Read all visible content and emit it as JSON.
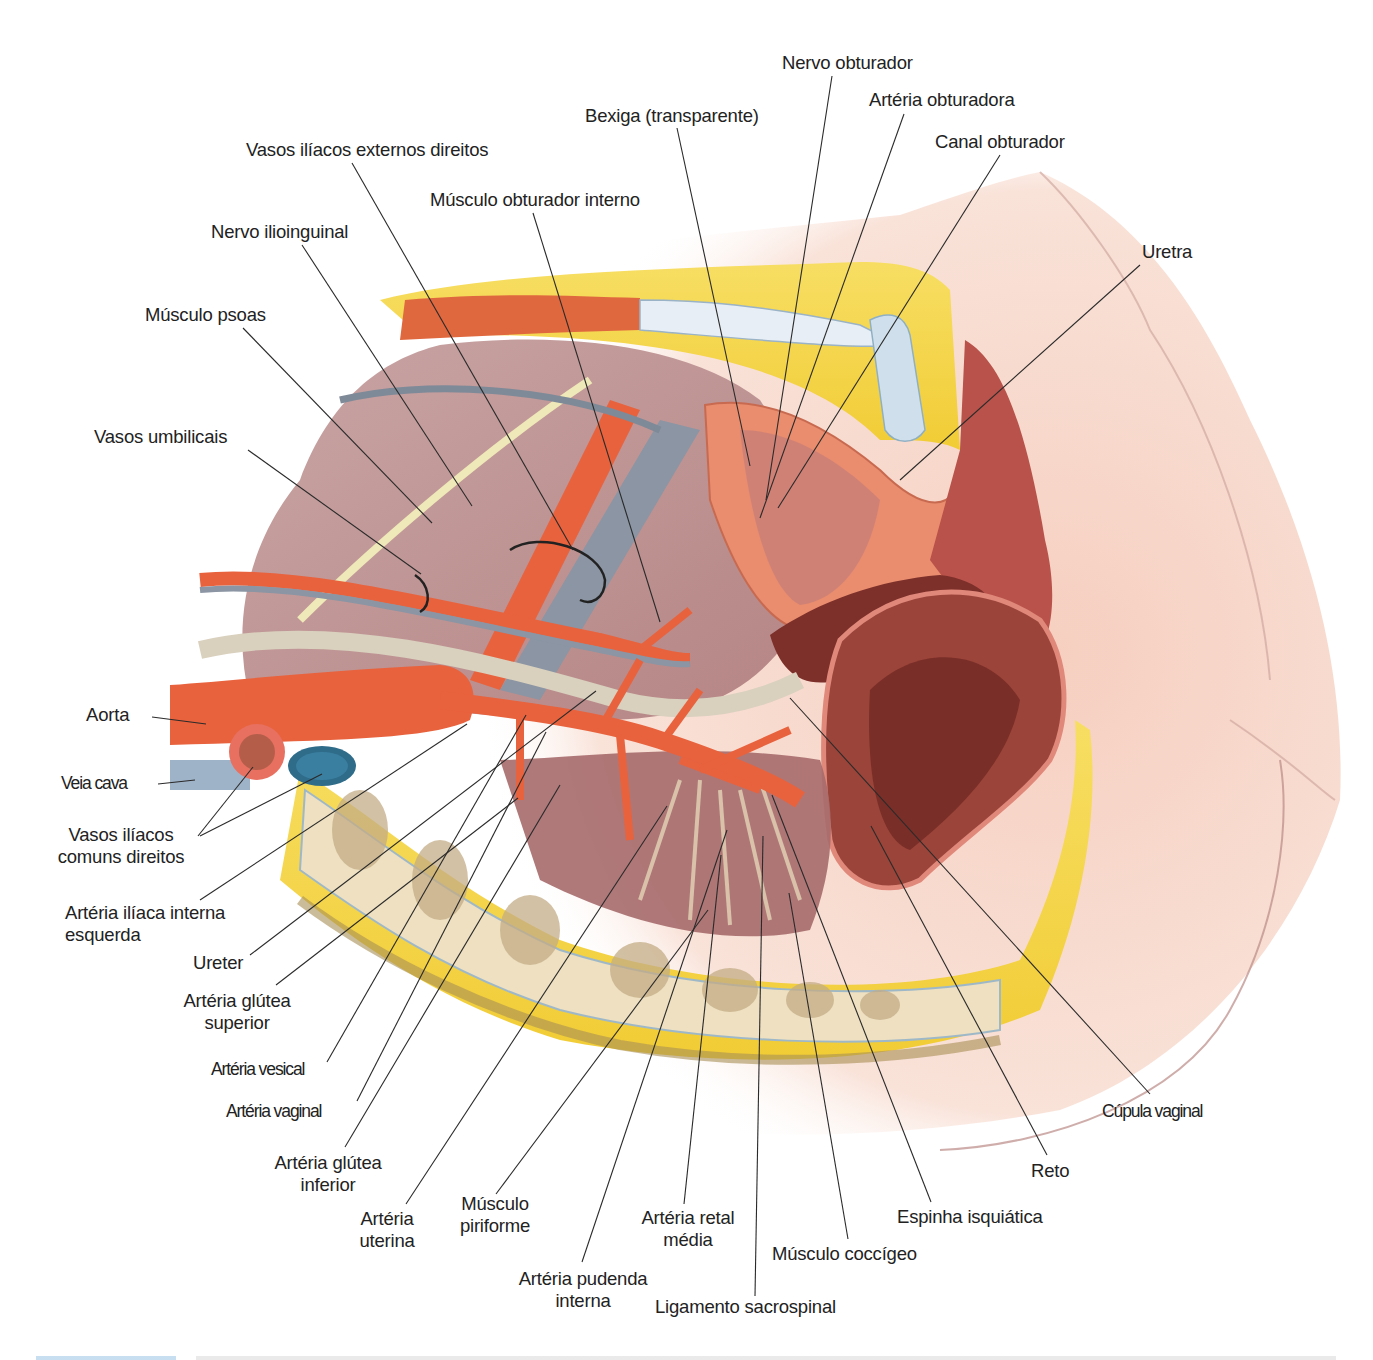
{
  "figure": {
    "type": "anatomical-illustration",
    "colors": {
      "fat": "#f2cf3a",
      "muscle": "#e5704a",
      "artery": "#e8623d",
      "vein": "#2e6c8a",
      "vena_cava": "#9fb3c8",
      "pelvic_wall": "#b98a86",
      "skin": "#f7d9cc",
      "bone": "#efe3c3",
      "rectum": "#8e3a30",
      "text": "#222222",
      "leader": "#2a2a2a"
    }
  },
  "labels": [
    {
      "id": "nervo-obturador",
      "text": "Nervo obturador",
      "x": 782,
      "y": 52,
      "align": "left"
    },
    {
      "id": "arteria-obturadora",
      "text": "Artéria obturadora",
      "x": 869,
      "y": 89,
      "align": "left"
    },
    {
      "id": "bexiga",
      "text": "Bexiga (transparente)",
      "x": 585,
      "y": 105,
      "align": "left"
    },
    {
      "id": "canal-obturador",
      "text": "Canal obturador",
      "x": 935,
      "y": 131,
      "align": "left"
    },
    {
      "id": "vasos-iliacos-externos",
      "text": "Vasos ilíacos externos direitos",
      "x": 246,
      "y": 139,
      "align": "left"
    },
    {
      "id": "musculo-obturador-interno",
      "text": "Músculo obturador interno",
      "x": 430,
      "y": 189,
      "align": "left"
    },
    {
      "id": "nervo-ilioinguinal",
      "text": "Nervo ilioinguinal",
      "x": 211,
      "y": 221,
      "align": "left"
    },
    {
      "id": "uretra",
      "text": "Uretra",
      "x": 1142,
      "y": 241,
      "align": "left"
    },
    {
      "id": "musculo-psoas",
      "text": "Músculo psoas",
      "x": 145,
      "y": 304,
      "align": "left"
    },
    {
      "id": "vasos-umbilicais",
      "text": "Vasos umbilicais",
      "x": 94,
      "y": 426,
      "align": "left"
    },
    {
      "id": "aorta",
      "text": "Aorta",
      "x": 86,
      "y": 704,
      "align": "left"
    },
    {
      "id": "veia-cava",
      "text": "Veia cava",
      "x": 61,
      "y": 772,
      "align": "left",
      "condensed": true
    },
    {
      "id": "vasos-iliacos-comuns",
      "text": "Vasos ilíacos\ncomuns direitos",
      "x": 46,
      "y": 824,
      "align": "center",
      "w": 150
    },
    {
      "id": "arteria-iliaca-interna",
      "text": "Artéria ilíaca interna\nesquerda",
      "x": 65,
      "y": 902,
      "align": "left"
    },
    {
      "id": "ureter",
      "text": "Ureter",
      "x": 193,
      "y": 952,
      "align": "left"
    },
    {
      "id": "arteria-glutea-superior",
      "text": "Artéria glútea\nsuperior",
      "x": 172,
      "y": 990,
      "align": "center",
      "w": 130
    },
    {
      "id": "arteria-vesical",
      "text": "Artéria vesical",
      "x": 211,
      "y": 1058,
      "align": "left",
      "condensed": true
    },
    {
      "id": "arteria-vaginal",
      "text": "Artéria vaginal",
      "x": 226,
      "y": 1100,
      "align": "left",
      "condensed": true
    },
    {
      "id": "arteria-glutea-inferior",
      "text": "Artéria glútea\ninferior",
      "x": 264,
      "y": 1152,
      "align": "center",
      "w": 128
    },
    {
      "id": "arteria-uterina",
      "text": "Artéria\nuterina",
      "x": 352,
      "y": 1208,
      "align": "center",
      "w": 70
    },
    {
      "id": "musculo-piriforme",
      "text": "Músculo\npiriforme",
      "x": 452,
      "y": 1193,
      "align": "center",
      "w": 86
    },
    {
      "id": "arteria-pudenda-interna",
      "text": "Artéria pudenda\ninterna",
      "x": 509,
      "y": 1268,
      "align": "center",
      "w": 148
    },
    {
      "id": "arteria-retal-media",
      "text": "Artéria retal\nmédia",
      "x": 632,
      "y": 1207,
      "align": "center",
      "w": 112
    },
    {
      "id": "ligamento-sacrospinal",
      "text": "Ligamento sacrospinal",
      "x": 655,
      "y": 1296,
      "align": "left"
    },
    {
      "id": "musculo-coccigeo",
      "text": "Músculo coccígeo",
      "x": 772,
      "y": 1243,
      "align": "left"
    },
    {
      "id": "espinha-isquiatica",
      "text": "Espinha isquiática",
      "x": 897,
      "y": 1206,
      "align": "left"
    },
    {
      "id": "reto",
      "text": "Reto",
      "x": 1031,
      "y": 1160,
      "align": "left"
    },
    {
      "id": "cupula-vaginal",
      "text": "Cúpula vaginal",
      "x": 1102,
      "y": 1100,
      "align": "left",
      "condensed": true
    }
  ],
  "leader_lines": [
    {
      "label": "nervo-obturador",
      "x1": 832,
      "y1": 76,
      "x2": 766,
      "y2": 500
    },
    {
      "label": "arteria-obturadora",
      "x1": 904,
      "y1": 114,
      "x2": 760,
      "y2": 518
    },
    {
      "label": "bexiga",
      "x1": 677,
      "y1": 128,
      "x2": 750,
      "y2": 466
    },
    {
      "label": "canal-obturador",
      "x1": 1000,
      "y1": 155,
      "x2": 778,
      "y2": 508
    },
    {
      "label": "vasos-iliacos-externos",
      "x1": 352,
      "y1": 163,
      "x2": 573,
      "y2": 550
    },
    {
      "label": "musculo-obturador-interno",
      "x1": 533,
      "y1": 213,
      "x2": 660,
      "y2": 622
    },
    {
      "label": "nervo-ilioinguinal",
      "x1": 302,
      "y1": 245,
      "x2": 472,
      "y2": 506
    },
    {
      "label": "uretra",
      "x1": 1140,
      "y1": 265,
      "x2": 900,
      "y2": 480
    },
    {
      "label": "musculo-psoas",
      "x1": 243,
      "y1": 328,
      "x2": 432,
      "y2": 523
    },
    {
      "label": "vasos-umbilicais",
      "x1": 248,
      "y1": 450,
      "x2": 421,
      "y2": 574
    },
    {
      "label": "aorta",
      "x1": 152,
      "y1": 717,
      "x2": 206,
      "y2": 724
    },
    {
      "label": "veia-cava",
      "x1": 158,
      "y1": 784,
      "x2": 195,
      "y2": 780
    },
    {
      "label": "vasos-iliacos-comuns",
      "x1": 198,
      "y1": 836,
      "x2": 253,
      "y2": 767
    },
    {
      "label": "vasos-iliacos-comuns",
      "x1": 200,
      "y1": 836,
      "x2": 322,
      "y2": 774
    },
    {
      "label": "arteria-iliaca-interna",
      "x1": 200,
      "y1": 900,
      "x2": 467,
      "y2": 724
    },
    {
      "label": "ureter",
      "x1": 250,
      "y1": 955,
      "x2": 596,
      "y2": 691
    },
    {
      "label": "arteria-glutea-superior",
      "x1": 276,
      "y1": 985,
      "x2": 518,
      "y2": 798
    },
    {
      "label": "arteria-vesical",
      "x1": 327,
      "y1": 1062,
      "x2": 526,
      "y2": 715
    },
    {
      "label": "arteria-vaginal",
      "x1": 357,
      "y1": 1101,
      "x2": 546,
      "y2": 732
    },
    {
      "label": "arteria-glutea-inferior",
      "x1": 345,
      "y1": 1147,
      "x2": 560,
      "y2": 785
    },
    {
      "label": "arteria-uterina",
      "x1": 406,
      "y1": 1204,
      "x2": 667,
      "y2": 806
    },
    {
      "label": "musculo-piriforme",
      "x1": 496,
      "y1": 1194,
      "x2": 708,
      "y2": 910
    },
    {
      "label": "arteria-pudenda-interna",
      "x1": 582,
      "y1": 1262,
      "x2": 727,
      "y2": 830
    },
    {
      "label": "arteria-retal-media",
      "x1": 684,
      "y1": 1204,
      "x2": 721,
      "y2": 855
    },
    {
      "label": "ligamento-sacrospinal",
      "x1": 755,
      "y1": 1296,
      "x2": 763,
      "y2": 836
    },
    {
      "label": "musculo-coccigeo",
      "x1": 848,
      "y1": 1239,
      "x2": 789,
      "y2": 893
    },
    {
      "label": "espinha-isquiatica",
      "x1": 931,
      "y1": 1202,
      "x2": 772,
      "y2": 795
    },
    {
      "label": "reto",
      "x1": 1047,
      "y1": 1155,
      "x2": 871,
      "y2": 826
    },
    {
      "label": "cupula-vaginal",
      "x1": 1150,
      "y1": 1094,
      "x2": 790,
      "y2": 698
    }
  ],
  "caption": {
    "visible": "partial",
    "text": ""
  }
}
